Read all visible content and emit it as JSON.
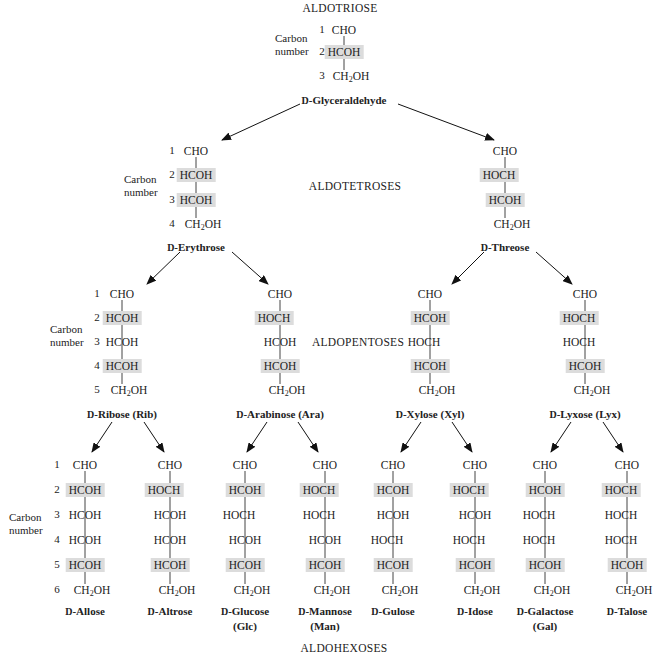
{
  "headings": {
    "triose": "ALDOTRIOSE",
    "tetroses": "ALDOTETROSES",
    "pentoses": "ALDOPENTOSES",
    "hexoses": "ALDOHEXOSES"
  },
  "carbon_number_label": [
    "Carbon",
    "number"
  ],
  "highlight_color": "#dcdcdc",
  "sugars": [
    {
      "id": "glyceraldehyde",
      "prefix": "D",
      "name": "-Glyceraldehyde",
      "abbr": "",
      "level": "triose",
      "x": 344,
      "rows": [
        "CHO",
        "HCOH",
        "CH2OH"
      ],
      "highlight": [
        1
      ]
    },
    {
      "id": "erythrose",
      "prefix": "D",
      "name": "-Erythrose",
      "abbr": "",
      "level": "tetrose",
      "x": 196,
      "rows": [
        "CHO",
        "HCOH",
        "HCOH",
        "CH2OH"
      ],
      "highlight": [
        1,
        2
      ]
    },
    {
      "id": "threose",
      "prefix": "D",
      "name": "-Threose",
      "abbr": "",
      "level": "tetrose",
      "x": 505,
      "rows": [
        "CHO",
        "HOCH",
        "HCOH",
        "CH2OH"
      ],
      "highlight": [
        1,
        2
      ]
    },
    {
      "id": "ribose",
      "prefix": "D",
      "name": "-Ribose",
      "abbr": "(Rib)",
      "level": "pentose",
      "x": 122,
      "rows": [
        "CHO",
        "HCOH",
        "HCOH",
        "HCOH",
        "CH2OH"
      ],
      "highlight": [
        1,
        3
      ]
    },
    {
      "id": "arabinose",
      "prefix": "D",
      "name": "-Arabinose",
      "abbr": "(Ara)",
      "level": "pentose",
      "x": 280,
      "rows": [
        "CHO",
        "HOCH",
        "HCOH",
        "HCOH",
        "CH2OH"
      ],
      "highlight": [
        1,
        3
      ]
    },
    {
      "id": "xylose",
      "prefix": "D",
      "name": "-Xylose",
      "abbr": "(Xyl)",
      "level": "pentose",
      "x": 430,
      "rows": [
        "CHO",
        "HCOH",
        "HOCH",
        "HCOH",
        "CH2OH"
      ],
      "highlight": [
        1,
        3
      ]
    },
    {
      "id": "lyxose",
      "prefix": "D",
      "name": "-Lyxose",
      "abbr": "(Lyx)",
      "level": "pentose",
      "x": 585,
      "rows": [
        "CHO",
        "HOCH",
        "HOCH",
        "HCOH",
        "CH2OH"
      ],
      "highlight": [
        1,
        3
      ]
    },
    {
      "id": "allose",
      "prefix": "D",
      "name": "-Allose",
      "abbr": "",
      "level": "hexose",
      "x": 85,
      "rows": [
        "CHO",
        "HCOH",
        "HCOH",
        "HCOH",
        "HCOH",
        "CH2OH"
      ],
      "highlight": [
        1,
        4
      ]
    },
    {
      "id": "altrose",
      "prefix": "D",
      "name": "-Altrose",
      "abbr": "",
      "level": "hexose",
      "x": 170,
      "rows": [
        "CHO",
        "HOCH",
        "HCOH",
        "HCOH",
        "HCOH",
        "CH2OH"
      ],
      "highlight": [
        1,
        4
      ]
    },
    {
      "id": "glucose",
      "prefix": "D",
      "name": "-Glucose",
      "abbr": "(Glc)",
      "level": "hexose",
      "x": 245,
      "rows": [
        "CHO",
        "HCOH",
        "HOCH",
        "HCOH",
        "HCOH",
        "CH2OH"
      ],
      "highlight": [
        1,
        4
      ]
    },
    {
      "id": "mannose",
      "prefix": "D",
      "name": "-Mannose",
      "abbr": "(Man)",
      "level": "hexose",
      "x": 325,
      "rows": [
        "CHO",
        "HOCH",
        "HOCH",
        "HCOH",
        "HCOH",
        "CH2OH"
      ],
      "highlight": [
        1,
        4
      ]
    },
    {
      "id": "gulose",
      "prefix": "D",
      "name": "-Gulose",
      "abbr": "",
      "level": "hexose",
      "x": 393,
      "rows": [
        "CHO",
        "HCOH",
        "HCOH",
        "HOCH",
        "HCOH",
        "CH2OH"
      ],
      "highlight": [
        1,
        4
      ]
    },
    {
      "id": "idose",
      "prefix": "D",
      "name": "-Idose",
      "abbr": "",
      "level": "hexose",
      "x": 475,
      "rows": [
        "CHO",
        "HOCH",
        "HCOH",
        "HOCH",
        "HCOH",
        "CH2OH"
      ],
      "highlight": [
        1,
        4
      ]
    },
    {
      "id": "galactose",
      "prefix": "D",
      "name": "-Galactose",
      "abbr": "(Gal)",
      "level": "hexose",
      "x": 545,
      "rows": [
        "CHO",
        "HCOH",
        "HOCH",
        "HOCH",
        "HCOH",
        "CH2OH"
      ],
      "highlight": [
        1,
        4
      ]
    },
    {
      "id": "talose",
      "prefix": "D",
      "name": "-Talose",
      "abbr": "",
      "level": "hexose",
      "x": 627,
      "rows": [
        "CHO",
        "HOCH",
        "HOCH",
        "HOCH",
        "HCOH",
        "CH2OH"
      ],
      "highlight": [
        1,
        4
      ]
    }
  ],
  "levels": {
    "triose": {
      "row_y": [
        30,
        52,
        76
      ],
      "label_y": 100
    },
    "tetrose": {
      "row_y": [
        151,
        175,
        200,
        224
      ],
      "label_y": 247
    },
    "pentose": {
      "row_y": [
        294,
        318,
        342,
        366,
        390
      ],
      "label_y": 414
    },
    "hexose": {
      "row_y": [
        465,
        490,
        515,
        540,
        565,
        590
      ],
      "label_y": 611
    }
  },
  "carbon_numbers": {
    "triose": {
      "x": 322,
      "values": [
        "1",
        "2",
        "3"
      ],
      "label_x": 275,
      "label_y": 40
    },
    "tetrose": {
      "x": 172,
      "values": [
        "1",
        "2",
        "3",
        "4"
      ],
      "label_x": 124,
      "label_y": 181
    },
    "pentose": {
      "x": 97,
      "values": [
        "1",
        "2",
        "3",
        "4",
        "5"
      ],
      "label_x": 50,
      "label_y": 331
    },
    "hexose": {
      "x": 57,
      "values": [
        "1",
        "2",
        "3",
        "4",
        "5",
        "6"
      ],
      "label_x": 9,
      "label_y": 519
    }
  },
  "arrows": [
    {
      "from": "glyceraldehyde",
      "to": "erythrose",
      "x1": 300,
      "y1": 104,
      "x2": 222,
      "y2": 140
    },
    {
      "from": "glyceraldehyde",
      "to": "threose",
      "x1": 398,
      "y1": 104,
      "x2": 494,
      "y2": 140
    },
    {
      "from": "erythrose",
      "to": "ribose",
      "x1": 180,
      "y1": 252,
      "x2": 147,
      "y2": 284
    },
    {
      "from": "erythrose",
      "to": "arabinose",
      "x1": 232,
      "y1": 252,
      "x2": 268,
      "y2": 284
    },
    {
      "from": "threose",
      "to": "xylose",
      "x1": 484,
      "y1": 252,
      "x2": 452,
      "y2": 284
    },
    {
      "from": "threose",
      "to": "lyxose",
      "x1": 536,
      "y1": 252,
      "x2": 572,
      "y2": 284
    },
    {
      "from": "ribose",
      "to": "allose",
      "x1": 112,
      "y1": 422,
      "x2": 92,
      "y2": 452
    },
    {
      "from": "ribose",
      "to": "altrose",
      "x1": 144,
      "y1": 422,
      "x2": 164,
      "y2": 452
    },
    {
      "from": "arabinose",
      "to": "glucose",
      "x1": 267,
      "y1": 422,
      "x2": 247,
      "y2": 452
    },
    {
      "from": "arabinose",
      "to": "mannose",
      "x1": 298,
      "y1": 422,
      "x2": 318,
      "y2": 452
    },
    {
      "from": "xylose",
      "to": "gulose",
      "x1": 421,
      "y1": 422,
      "x2": 401,
      "y2": 452
    },
    {
      "from": "xylose",
      "to": "idose",
      "x1": 452,
      "y1": 422,
      "x2": 472,
      "y2": 452
    },
    {
      "from": "lyxose",
      "to": "galactose",
      "x1": 571,
      "y1": 422,
      "x2": 551,
      "y2": 452
    },
    {
      "from": "lyxose",
      "to": "talose",
      "x1": 603,
      "y1": 422,
      "x2": 623,
      "y2": 452
    }
  ],
  "heading_positions": {
    "triose": [
      340,
      8
    ],
    "tetroses": [
      355,
      187
    ],
    "pentoses": [
      358,
      337
    ],
    "hexoses": [
      344,
      648
    ]
  }
}
